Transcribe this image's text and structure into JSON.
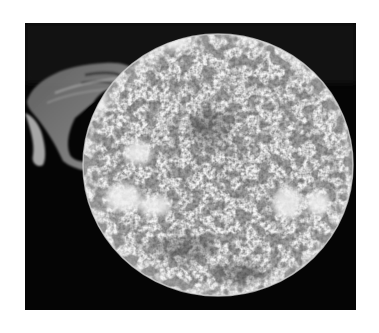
{
  "image": {
    "subject": "Sun with solar prominence",
    "alt": "Grayscale image of the Sun showing granulated chromosphere texture, bright active regions, and a large looping prominence on the upper-left limb against a black background",
    "colors": {
      "background": "#ffffff",
      "space": "#050505",
      "disk_base": "#8a8a8a",
      "disk_bright": "#e8e8e8",
      "disk_dark": "#2a2a2a",
      "prominence": "#9a9a9a"
    }
  }
}
